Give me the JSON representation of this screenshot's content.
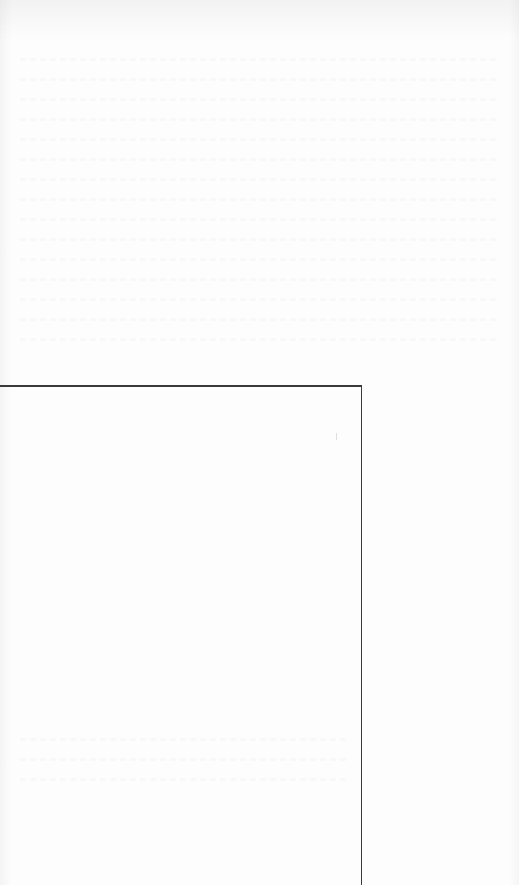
{
  "document": {
    "type": "scanned-page",
    "legible_text": [],
    "background_color": "#fdfdfd",
    "rule_color": "#3a3a3a",
    "rules": [
      {
        "orientation": "horizontal",
        "x1": 0,
        "x2": 362,
        "y": 385
      },
      {
        "orientation": "vertical",
        "x": 361,
        "y1": 385,
        "y2": 885
      }
    ]
  }
}
